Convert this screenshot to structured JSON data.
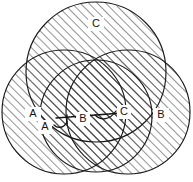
{
  "diagram": {
    "type": "venn-three-circle-hatched",
    "title": "",
    "background_color": "#ffffff",
    "stroke_color": "#1a1a1a",
    "hatch_color": "#3a3a3a",
    "hatch_angle_deg": 45,
    "hatch_spacing_px": 6,
    "circles": [
      {
        "id": "top",
        "label": "C",
        "cx": 96,
        "cy": 72,
        "r": 70,
        "label_x": 96,
        "label_y": 24
      },
      {
        "id": "left",
        "label": "A",
        "cx": 64,
        "cy": 112,
        "r": 62,
        "label_x": 33,
        "label_y": 114
      },
      {
        "id": "right",
        "label": "B",
        "cx": 128,
        "cy": 112,
        "r": 62,
        "label_x": 161,
        "label_y": 115
      },
      {
        "id": "middle",
        "label": "",
        "cx": 96,
        "cy": 116,
        "r": 56,
        "label_x": 0,
        "label_y": 0
      }
    ],
    "annotations": {
      "label_a": "A",
      "label_b": "B",
      "label_c": "C",
      "label_a_x": 45,
      "label_a_y": 127,
      "label_b_x": 83,
      "label_b_y": 119,
      "label_c_x": 124,
      "label_c_y": 112
    }
  }
}
